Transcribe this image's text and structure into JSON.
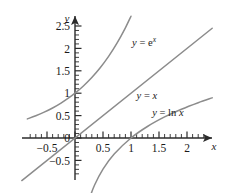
{
  "chart_data": {
    "type": "line",
    "title": "",
    "xlabel": "x",
    "ylabel": "y",
    "xlim": [
      -0.85,
      2.45
    ],
    "ylim": [
      -0.95,
      2.75
    ],
    "grid": false,
    "legend_position": "inline-annotations",
    "x_ticks_major": [
      -0.5,
      0,
      0.5,
      1,
      1.5,
      2
    ],
    "x_tick_labels": [
      "−0.5",
      "0",
      "0.5",
      "1",
      "1.5",
      "2"
    ],
    "y_ticks_major": [
      -0.5,
      0,
      0.5,
      1,
      1.5,
      2,
      2.5
    ],
    "y_tick_labels": [
      "−0.5",
      "0",
      "0.5",
      "1",
      "1.5",
      "2",
      "2.5"
    ],
    "minor_tick_step": 0.1,
    "series": [
      {
        "name": "y = e^x",
        "label": "y = e",
        "label_exponent": "x",
        "equation": "y = e^x",
        "color": "#8c8c8c",
        "label_x": 1.02,
        "label_y": 2.05,
        "points": [
          {
            "x": -0.85,
            "y": 0.427
          },
          {
            "x": -0.7,
            "y": 0.497
          },
          {
            "x": -0.55,
            "y": 0.577
          },
          {
            "x": -0.4,
            "y": 0.67
          },
          {
            "x": -0.25,
            "y": 0.779
          },
          {
            "x": -0.1,
            "y": 0.905
          },
          {
            "x": 0.0,
            "y": 1.0
          },
          {
            "x": 0.15,
            "y": 1.162
          },
          {
            "x": 0.3,
            "y": 1.35
          },
          {
            "x": 0.45,
            "y": 1.568
          },
          {
            "x": 0.6,
            "y": 1.822
          },
          {
            "x": 0.75,
            "y": 2.117
          },
          {
            "x": 0.9,
            "y": 2.46
          },
          {
            "x": 1.0,
            "y": 2.718
          }
        ]
      },
      {
        "name": "y = x",
        "label": "y = x",
        "equation": "y = x",
        "color": "#8c8c8c",
        "label_x": 1.1,
        "label_y": 0.88,
        "points": [
          {
            "x": -0.95,
            "y": -0.95
          },
          {
            "x": 2.45,
            "y": 2.45
          }
        ]
      },
      {
        "name": "y = ln x",
        "label": "y = ln x",
        "equation": "y = ln x",
        "color": "#8c8c8c",
        "label_x": 1.38,
        "label_y": 0.48,
        "points": [
          {
            "x": 0.085,
            "y": -2.465
          },
          {
            "x": 0.12,
            "y": -2.12
          },
          {
            "x": 0.18,
            "y": -1.715
          },
          {
            "x": 0.25,
            "y": -1.386
          },
          {
            "x": 0.35,
            "y": -1.05
          },
          {
            "x": 0.5,
            "y": -0.693
          },
          {
            "x": 0.7,
            "y": -0.357
          },
          {
            "x": 1.0,
            "y": 0.0
          },
          {
            "x": 1.3,
            "y": 0.262
          },
          {
            "x": 1.6,
            "y": 0.47
          },
          {
            "x": 1.9,
            "y": 0.642
          },
          {
            "x": 2.2,
            "y": 0.788
          },
          {
            "x": 2.45,
            "y": 0.896
          }
        ]
      }
    ]
  },
  "axes": {
    "x_axis_label": "x",
    "y_axis_label": "y",
    "x_labels": [
      {
        "text": "−0.5",
        "value": -0.5
      },
      {
        "text": "0.5",
        "value": 0.5
      },
      {
        "text": "1",
        "value": 1
      },
      {
        "text": "1.5",
        "value": 1.5
      },
      {
        "text": "2",
        "value": 2
      }
    ],
    "y_labels": [
      {
        "text": "2.5",
        "value": 2.5
      },
      {
        "text": "2",
        "value": 2
      },
      {
        "text": "1.5",
        "value": 1.5
      },
      {
        "text": "1",
        "value": 1
      },
      {
        "text": "0.5",
        "value": 0.5
      },
      {
        "text": "0",
        "value": 0
      },
      {
        "text": "−0.5",
        "value": -0.5
      }
    ]
  },
  "style": {
    "axis_color": "#2b2b2b",
    "curve_color": "#8c8c8c",
    "text_color": "#1a1a1a",
    "background": "#ffffff"
  }
}
